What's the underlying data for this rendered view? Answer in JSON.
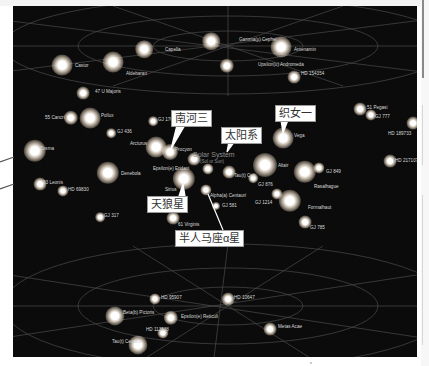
{
  "diagram": {
    "type": "3D star map of stars near the Solar System",
    "background_color": "#0b0b0b",
    "grid_line_color": "#4a4a4a",
    "center": {
      "label": "Solar System",
      "sublabel": "(Sol or Sun)"
    },
    "callouts": [
      {
        "id": "procyon",
        "text": "南河三",
        "target": "Procyon"
      },
      {
        "id": "sun",
        "text": "太阳系",
        "target": "Solar System"
      },
      {
        "id": "vega",
        "text": "织女一",
        "target": "Vega"
      },
      {
        "id": "sirius",
        "text": "天狼星",
        "target": "Sirius"
      },
      {
        "id": "alpha-centauri",
        "text": "半人马座α星",
        "target": "Alpha(a) Centauri"
      }
    ],
    "stars": [
      {
        "name": "Capella",
        "x": 131,
        "y": 43,
        "size": 11
      },
      {
        "name": "Castor",
        "x": 49,
        "y": 59,
        "size": 13
      },
      {
        "name": "Aldebaran",
        "x": 100,
        "y": 56,
        "size": 13
      },
      {
        "name": "Gamma(y) Cephei",
        "x": 198,
        "y": 35,
        "size": 11
      },
      {
        "name": "Antenamin",
        "x": 268,
        "y": 41,
        "size": 13
      },
      {
        "name": "Upsilon(u) Andromeda",
        "x": 214,
        "y": 60,
        "size": 9
      },
      {
        "name": "HD 154354",
        "x": 281,
        "y": 71,
        "size": 8
      },
      {
        "name": "47 U Majoris",
        "x": 70,
        "y": 87,
        "size": 8
      },
      {
        "name": "55 Cancri",
        "x": 58,
        "y": 112,
        "size": 9
      },
      {
        "name": "Pollux",
        "x": 77,
        "y": 112,
        "size": 13
      },
      {
        "name": "GJ 176",
        "x": 140,
        "y": 115,
        "size": 6
      },
      {
        "name": "GJ 436",
        "x": 98,
        "y": 127,
        "size": 6
      },
      {
        "name": "Arcturus",
        "x": 143,
        "y": 141,
        "size": 13
      },
      {
        "name": "Procyon",
        "x": 157,
        "y": 146,
        "size": 10
      },
      {
        "name": "Zosma",
        "x": 22,
        "y": 145,
        "size": 14
      },
      {
        "name": "Epsilon(e) Eridani",
        "x": 181,
        "y": 153,
        "size": 8
      },
      {
        "name": "Denebola",
        "x": 95,
        "y": 167,
        "size": 14
      },
      {
        "name": "Sirius",
        "x": 171,
        "y": 173,
        "size": 14
      },
      {
        "name": "83 Leonis",
        "x": 27,
        "y": 178,
        "size": 8
      },
      {
        "name": "HD 69830",
        "x": 50,
        "y": 185,
        "size": 7
      },
      {
        "name": "Solar System",
        "x": 195,
        "y": 163,
        "size": 7
      },
      {
        "name": "Tau(t) Ceti",
        "x": 216,
        "y": 166,
        "size": 8
      },
      {
        "name": "Alpha(a) Centauri",
        "x": 193,
        "y": 184,
        "size": 7
      },
      {
        "name": "GJ 581",
        "x": 203,
        "y": 200,
        "size": 5
      },
      {
        "name": "61 Virginis",
        "x": 160,
        "y": 212,
        "size": 8
      },
      {
        "name": "GJ 317",
        "x": 87,
        "y": 211,
        "size": 6
      },
      {
        "name": "Vega",
        "x": 270,
        "y": 132,
        "size": 13
      },
      {
        "name": "Altair",
        "x": 252,
        "y": 159,
        "size": 15
      },
      {
        "name": "GJ 876",
        "x": 240,
        "y": 172,
        "size": 6
      },
      {
        "name": "Rasalhague",
        "x": 292,
        "y": 166,
        "size": 14
      },
      {
        "name": "GJ 849",
        "x": 306,
        "y": 162,
        "size": 7
      },
      {
        "name": "GJ 1214",
        "x": 264,
        "y": 188,
        "size": 7
      },
      {
        "name": "Formalhaut",
        "x": 277,
        "y": 195,
        "size": 14
      },
      {
        "name": "GJ 785",
        "x": 292,
        "y": 216,
        "size": 8
      },
      {
        "name": "51 Pegasi",
        "x": 347,
        "y": 103,
        "size": 8
      },
      {
        "name": "GJ 777",
        "x": 358,
        "y": 109,
        "size": 7
      },
      {
        "name": "HD 189733",
        "x": 400,
        "y": 117,
        "size": 8
      },
      {
        "name": "HD 217107",
        "x": 377,
        "y": 155,
        "size": 8
      },
      {
        "name": "HD 95907",
        "x": 142,
        "y": 293,
        "size": 7
      },
      {
        "name": "HD 10647",
        "x": 215,
        "y": 293,
        "size": 8
      },
      {
        "name": "Beta(b) Pictoris",
        "x": 102,
        "y": 310,
        "size": 12
      },
      {
        "name": "Epsilon(e) Reticuli",
        "x": 158,
        "y": 312,
        "size": 9
      },
      {
        "name": "HD 113538",
        "x": 150,
        "y": 327,
        "size": 7
      },
      {
        "name": "Tau(t) Centauri",
        "x": 125,
        "y": 339,
        "size": 12
      },
      {
        "name": "Metas Acae",
        "x": 257,
        "y": 323,
        "size": 8
      }
    ],
    "star_labels": [
      {
        "text": "Capella",
        "x": 152,
        "y": 42
      },
      {
        "text": "Castor",
        "x": 62,
        "y": 58
      },
      {
        "text": "Aldebaran",
        "x": 113,
        "y": 66
      },
      {
        "text": "Gamma(y) Cephei",
        "x": 226,
        "y": 32
      },
      {
        "text": "Antenamin",
        "x": 281,
        "y": 42
      },
      {
        "text": "Upsilon(u) Andromeda",
        "x": 245,
        "y": 57
      },
      {
        "text": "HD 154354",
        "x": 288,
        "y": 66
      },
      {
        "text": "47 U Majoris",
        "x": 82,
        "y": 84
      },
      {
        "text": "55 Cancri",
        "x": 32,
        "y": 110
      },
      {
        "text": "Pollux",
        "x": 88,
        "y": 108
      },
      {
        "text": "GJ 176",
        "x": 145,
        "y": 112
      },
      {
        "text": "GJ 436",
        "x": 104,
        "y": 124
      },
      {
        "text": "Arcturus",
        "x": 117,
        "y": 136
      },
      {
        "text": "Procyon",
        "x": 162,
        "y": 142
      },
      {
        "text": "Zosma",
        "x": 27,
        "y": 141
      },
      {
        "text": "Epsilon(e) Eridani",
        "x": 140,
        "y": 161
      },
      {
        "text": "Denebola",
        "x": 108,
        "y": 166
      },
      {
        "text": "Sirius",
        "x": 152,
        "y": 182
      },
      {
        "text": "83 Leonis",
        "x": 30,
        "y": 175
      },
      {
        "text": "HD 69830",
        "x": 55,
        "y": 182
      },
      {
        "text": "Tau(t) Ceti",
        "x": 221,
        "y": 168
      },
      {
        "text": "Alpha(a) Centauri",
        "x": 197,
        "y": 188
      },
      {
        "text": "GJ 581",
        "x": 209,
        "y": 198
      },
      {
        "text": "61 Virginis",
        "x": 165,
        "y": 217
      },
      {
        "text": "GJ 317",
        "x": 91,
        "y": 208
      },
      {
        "text": "Vega",
        "x": 281,
        "y": 128
      },
      {
        "text": "Altair",
        "x": 265,
        "y": 158
      },
      {
        "text": "GJ 876",
        "x": 245,
        "y": 177
      },
      {
        "text": "Rasalhague",
        "x": 301,
        "y": 179
      },
      {
        "text": "GJ 849",
        "x": 313,
        "y": 164
      },
      {
        "text": "GJ 1214",
        "x": 242,
        "y": 195
      },
      {
        "text": "Formalhaut",
        "x": 295,
        "y": 200
      },
      {
        "text": "GJ 785",
        "x": 297,
        "y": 220
      },
      {
        "text": "51 Pegasi",
        "x": 354,
        "y": 100
      },
      {
        "text": "GJ 777",
        "x": 362,
        "y": 109
      },
      {
        "text": "HD 189733",
        "x": 375,
        "y": 126
      },
      {
        "text": "HD 217107",
        "x": 382,
        "y": 153
      },
      {
        "text": "HD 95907",
        "x": 148,
        "y": 290
      },
      {
        "text": "HD 10647",
        "x": 221,
        "y": 290
      },
      {
        "text": "Beta(b) Pictoris",
        "x": 110,
        "y": 305
      },
      {
        "text": "Epsilon(e) Reticuli",
        "x": 168,
        "y": 309
      },
      {
        "text": "HD 113538",
        "x": 133,
        "y": 322
      },
      {
        "text": "Tau(t) Centauri",
        "x": 99,
        "y": 334
      },
      {
        "text": "Metas Acae",
        "x": 265,
        "y": 319
      }
    ]
  }
}
